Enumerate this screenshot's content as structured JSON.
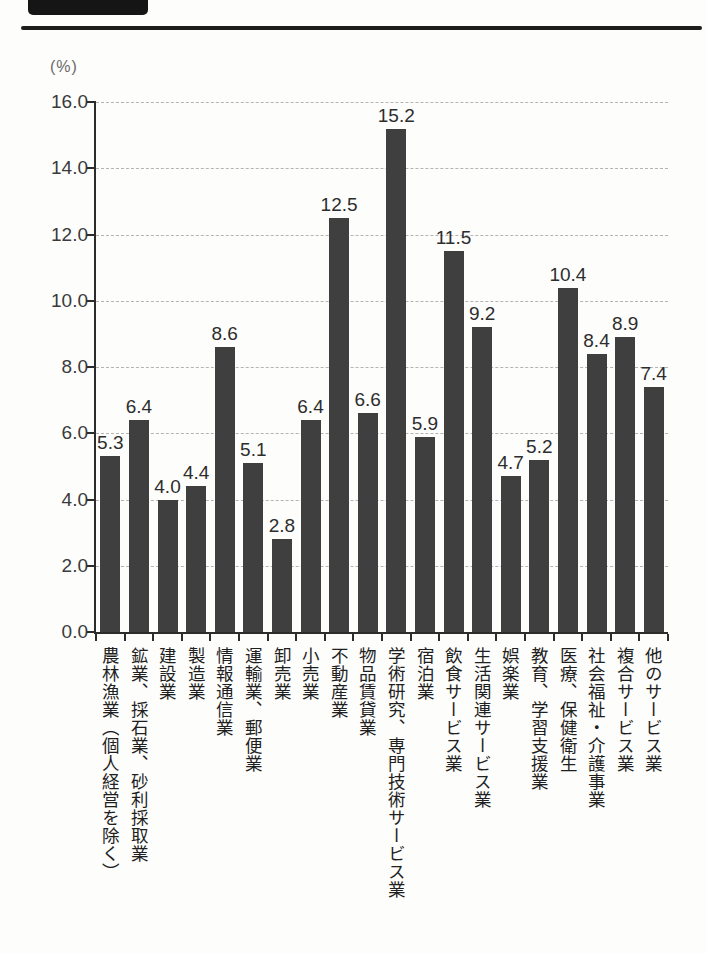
{
  "header": {
    "block_color": "#151515",
    "rule_color": "#1d1d1d"
  },
  "chart": {
    "unit_label": "(%)"
  },
  "chart_data": {
    "type": "bar",
    "title": "",
    "xlabel": "",
    "ylabel": "(%)",
    "ylim": [
      0,
      16
    ],
    "ytick_step": 2,
    "ytick_labels": [
      "0.0",
      "2.0",
      "4.0",
      "6.0",
      "8.0",
      "10.0",
      "12.0",
      "14.0",
      "16.0"
    ],
    "grid": "horizontal-dashed",
    "legend": "none",
    "bar_color": "#3f3f3f",
    "categories": [
      "農林漁業（個人経営を除く）",
      "鉱業、採石業、砂利採取業",
      "建設業",
      "製造業",
      "情報通信業",
      "運輸業、郵便業",
      "卸売業",
      "小売業",
      "不動産業",
      "物品賃貸業",
      "学術研究、専門技術サービス業",
      "宿泊業",
      "飲食サービス業",
      "生活関連サービス業",
      "娯楽業",
      "教育、学習支援業",
      "医療、保健衛生",
      "社会福祉・介護事業",
      "複合サービス業",
      "他のサービス業"
    ],
    "values": [
      5.3,
      6.4,
      4.0,
      4.4,
      8.6,
      5.1,
      2.8,
      6.4,
      12.5,
      6.6,
      15.2,
      5.9,
      11.5,
      9.2,
      4.7,
      5.2,
      10.4,
      8.4,
      8.9,
      7.4
    ],
    "value_labels": [
      "5.3",
      "6.4",
      "4.0",
      "4.4",
      "8.6",
      "5.1",
      "2.8",
      "6.4",
      "12.5",
      "6.6",
      "15.2",
      "5.9",
      "11.5",
      "9.2",
      "4.7",
      "5.2",
      "10.4",
      "8.4",
      "8.9",
      "7.4"
    ]
  }
}
